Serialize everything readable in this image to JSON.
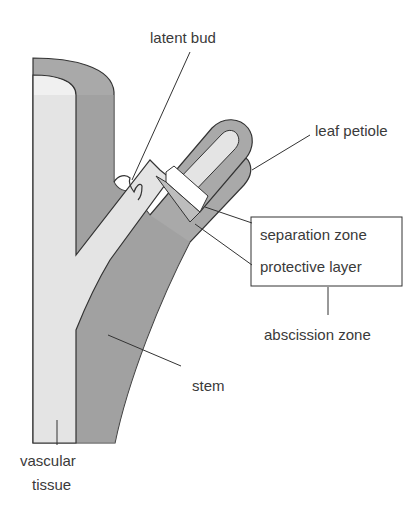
{
  "diagram": {
    "colors": {
      "outer_tissue": "#a9a9a9",
      "outer_tissue_dark": "#9c9c9c",
      "vascular": "#e4e4e4",
      "outline": "#333333",
      "label_text": "#3a3a3a"
    },
    "labels": {
      "latent_bud": "latent bud",
      "leaf_petiole": "leaf petiole",
      "separation_zone": "separation zone",
      "protective_layer": "protective layer",
      "abscission_zone": "abscission zone",
      "stem": "stem",
      "vascular_line1": "vascular",
      "vascular_line2": "tissue"
    }
  }
}
